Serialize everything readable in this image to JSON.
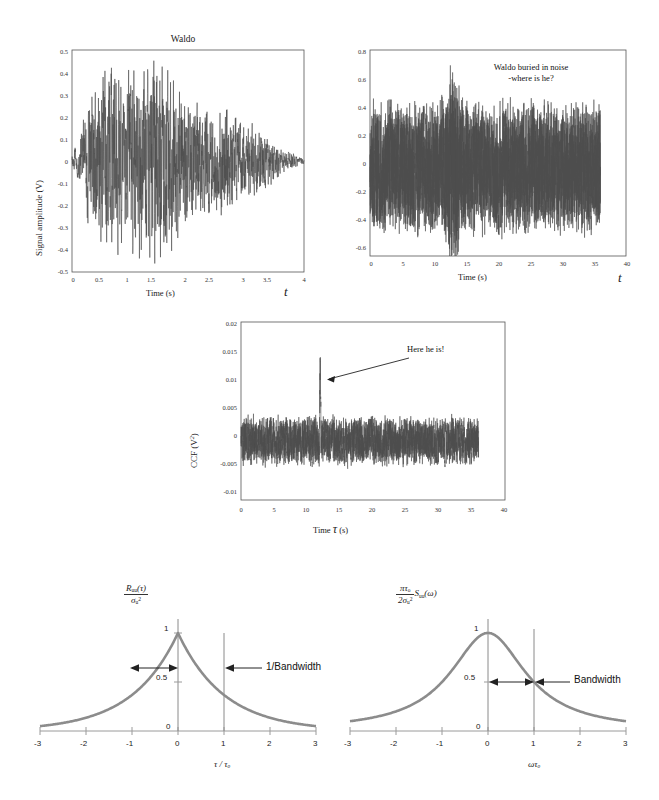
{
  "figure": {
    "trace_color": "#4d4d4d",
    "curve_color": "#8c8c8c",
    "axis_color": "#555555"
  },
  "panel_signal": {
    "title": "Waldo",
    "xlabel": "Time (s)",
    "ylabel": "Signal amplitude (V)",
    "x_var": "t",
    "xticks": [
      "0",
      "0.5",
      "1",
      "1.5",
      "2",
      "2.5",
      "3",
      "3.5",
      "4"
    ],
    "yticks": [
      "0.5",
      "0.4",
      "0.3",
      "0.2",
      "0.1",
      "0",
      "-0.1",
      "-0.2",
      "-0.3",
      "-0.4",
      "-0.5"
    ]
  },
  "panel_noise": {
    "annotation_line1": "Waldo buried in noise",
    "annotation_line2": "-where is he?",
    "xlabel": "Time (s)",
    "x_var": "t",
    "xticks": [
      "0",
      "5",
      "10",
      "15",
      "20",
      "25",
      "30",
      "35",
      "40"
    ],
    "yticks": [
      "0.8",
      "0.6",
      "0.4",
      "0.2",
      "0",
      "-0.2",
      "-0.4",
      "-0.6"
    ]
  },
  "panel_ccf": {
    "ylabel_main": "CCF (V",
    "ylabel_sup": "2",
    "ylabel_close": ")",
    "xlabel_pre": "Time",
    "xlabel_var": "τ",
    "xlabel_post": "(s)",
    "annotation": "Here he is!",
    "xticks": [
      "0",
      "5",
      "10",
      "15",
      "20",
      "25",
      "30",
      "35",
      "40"
    ],
    "yticks": [
      "0.02",
      "0.015",
      "0.01",
      "0.005",
      "0",
      "-0.005",
      "-0.01"
    ],
    "peak_time": "12"
  },
  "panel_acf": {
    "numerator_R": "R",
    "numerator_sub": "uu",
    "numerator_arg": "(τ)",
    "denominator_sigma": "σ",
    "denominator_sub": "u",
    "denominator_sup": "2",
    "xlabel_num": "τ",
    "xlabel_den": "τ",
    "xlabel_den_sub": "o",
    "annotation": "1/Bandwidth",
    "xticks": [
      "-3",
      "-2",
      "-1",
      "0",
      "1",
      "2",
      "3"
    ],
    "yticks": [
      "1",
      "0.5",
      "0"
    ]
  },
  "panel_psd": {
    "numerator": "πτ",
    "numerator_sub": "o",
    "denominator_2": "2σ",
    "denominator_sub": "u",
    "denominator_sup": "2",
    "s_term": "S",
    "s_sub": "uu",
    "s_arg": "(ω)",
    "xlabel_w": "ωτ",
    "xlabel_sub": "o",
    "annotation": "Bandwidth",
    "xticks": [
      "-3",
      "-2",
      "-1",
      "0",
      "1",
      "2",
      "3"
    ],
    "yticks": [
      "1",
      "0.5",
      "0"
    ]
  },
  "chart_data": [
    {
      "type": "line",
      "name": "waldo-signal",
      "title": "Waldo",
      "xlabel": "Time (s)",
      "ylabel": "Signal amplitude (V)",
      "xlim": [
        0,
        4
      ],
      "ylim": [
        -0.5,
        0.5
      ],
      "grid": false,
      "description": "Damped broadband random signal burst, amplitude envelope rising to ~0.45 V near t=0.6-1.6 s then decaying to near zero by t=3.8 s",
      "envelope_x": [
        0,
        0.15,
        0.3,
        0.6,
        0.9,
        1.2,
        1.5,
        1.8,
        2.1,
        2.4,
        2.7,
        3.0,
        3.3,
        3.6,
        4.0
      ],
      "envelope_y": [
        0.02,
        0.12,
        0.25,
        0.4,
        0.35,
        0.42,
        0.45,
        0.33,
        0.22,
        0.2,
        0.21,
        0.14,
        0.13,
        0.05,
        0.01
      ]
    },
    {
      "type": "line",
      "name": "waldo-in-noise",
      "xlabel": "Time (s)",
      "xlim": [
        0,
        40
      ],
      "ylim": [
        -0.6,
        0.8
      ],
      "grid": false,
      "description": "Dense white noise band of roughly +/-0.4 V spanning 0 to 36 s, with a slightly larger excursion to +0.63 / -0.55 V near t=13 s where the buried signal lies",
      "noise_band": 0.4,
      "burst_center": 13,
      "burst_peak": 0.63
    },
    {
      "type": "line",
      "name": "cross-correlation-function",
      "ylabel": "CCF (V^2)",
      "xlabel": "Time τ (s)",
      "xlim": [
        0,
        40
      ],
      "ylim": [
        -0.01,
        0.02
      ],
      "grid": false,
      "description": "Noise floor of about +/-0.004 V^2 with one sharp positive spike reaching 0.0158 V^2 at τ = 12 s",
      "noise_band": 0.0038,
      "peak_x": 12,
      "peak_y": 0.0158,
      "annotations": [
        {
          "text": "Here he is!",
          "points_to_x": 12,
          "points_to_y": 0.0115
        }
      ]
    },
    {
      "type": "line",
      "name": "normalized-autocorrelation",
      "xlabel": "τ / τo",
      "xlim": [
        -3,
        3
      ],
      "ylim": [
        0,
        1.05
      ],
      "grid": false,
      "description": "Two-sided exponential exp(-|x|) peaking at 1 at x=0, value 0.5 near |x|=0.69, vertical markers at x=0 and x=1, annotation 1/Bandwidth",
      "function": "exp(-abs(x))",
      "x": [
        -3,
        -2.5,
        -2,
        -1.5,
        -1,
        -0.5,
        0,
        0.5,
        1,
        1.5,
        2,
        2.5,
        3
      ],
      "values": [
        0.05,
        0.082,
        0.135,
        0.223,
        0.368,
        0.607,
        1.0,
        0.607,
        0.368,
        0.223,
        0.135,
        0.082,
        0.05
      ],
      "markers_x": [
        0,
        1
      ],
      "annotations": [
        {
          "text": "1/Bandwidth",
          "at_x": 1
        }
      ]
    },
    {
      "type": "line",
      "name": "normalized-power-spectral-density",
      "xlabel": "ωτo",
      "xlim": [
        -3,
        3
      ],
      "ylim": [
        0,
        1.05
      ],
      "grid": false,
      "description": "Lorentzian 1/(1+x^2) peaking at 1 at x=0, half power 0.5 at x=1, vertical markers at x=0 and x=1, annotation Bandwidth",
      "function": "1/(1+x^2)",
      "x": [
        -3,
        -2.5,
        -2,
        -1.5,
        -1,
        -0.5,
        0,
        0.5,
        1,
        1.5,
        2,
        2.5,
        3
      ],
      "values": [
        0.1,
        0.138,
        0.2,
        0.308,
        0.5,
        0.8,
        1.0,
        0.8,
        0.5,
        0.308,
        0.2,
        0.138,
        0.1
      ],
      "markers_x": [
        0,
        1
      ],
      "annotations": [
        {
          "text": "Bandwidth",
          "at_x": 1
        }
      ]
    }
  ]
}
